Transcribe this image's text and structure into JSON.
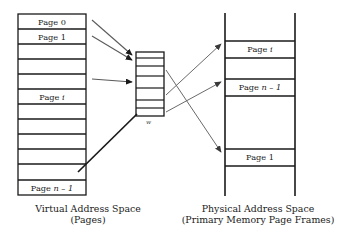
{
  "diagram": {
    "colors": {
      "stroke": "#1a1a1a",
      "arrow": "#4d4d4d",
      "background": "#ffffff",
      "text": "#1a1a1a"
    }
  },
  "virtual_space": {
    "caption_line1": "Virtual Address Space",
    "caption_line2": "(Pages)",
    "rows": [
      {
        "index": 0,
        "label": "Page 0",
        "italic_suffix": "",
        "labeled": true
      },
      {
        "index": 1,
        "label": "Page 1",
        "italic_suffix": "",
        "labeled": true
      },
      {
        "index": 2,
        "label": "",
        "italic_suffix": "",
        "labeled": false
      },
      {
        "index": 3,
        "label": "",
        "italic_suffix": "",
        "labeled": false
      },
      {
        "index": 4,
        "label": "",
        "italic_suffix": "",
        "labeled": false
      },
      {
        "index": 5,
        "label": "Page ",
        "italic_suffix": "i",
        "labeled": true
      },
      {
        "index": 6,
        "label": "",
        "italic_suffix": "",
        "labeled": false
      },
      {
        "index": 7,
        "label": "",
        "italic_suffix": "",
        "labeled": false
      },
      {
        "index": 8,
        "label": "",
        "italic_suffix": "",
        "labeled": false
      },
      {
        "index": 9,
        "label": "",
        "italic_suffix": "",
        "labeled": false
      },
      {
        "index": 10,
        "label": "",
        "italic_suffix": "",
        "labeled": false
      },
      {
        "index": 11,
        "label": "Page ",
        "italic_suffix": "n – 1",
        "labeled": true
      }
    ]
  },
  "page_table": {
    "note": "w",
    "row_count": 6
  },
  "physical_space": {
    "caption_line1": "Physical Address Space",
    "caption_line2": "(Primary Memory Page Frames)",
    "frames": [
      {
        "index": 0,
        "label": "Page ",
        "italic_suffix": "i",
        "labeled": true
      },
      {
        "index": 1,
        "label": "Page ",
        "italic_suffix": "n – 1",
        "labeled": true
      },
      {
        "index": 2,
        "label": "Page 1",
        "italic_suffix": "",
        "labeled": true
      }
    ]
  }
}
